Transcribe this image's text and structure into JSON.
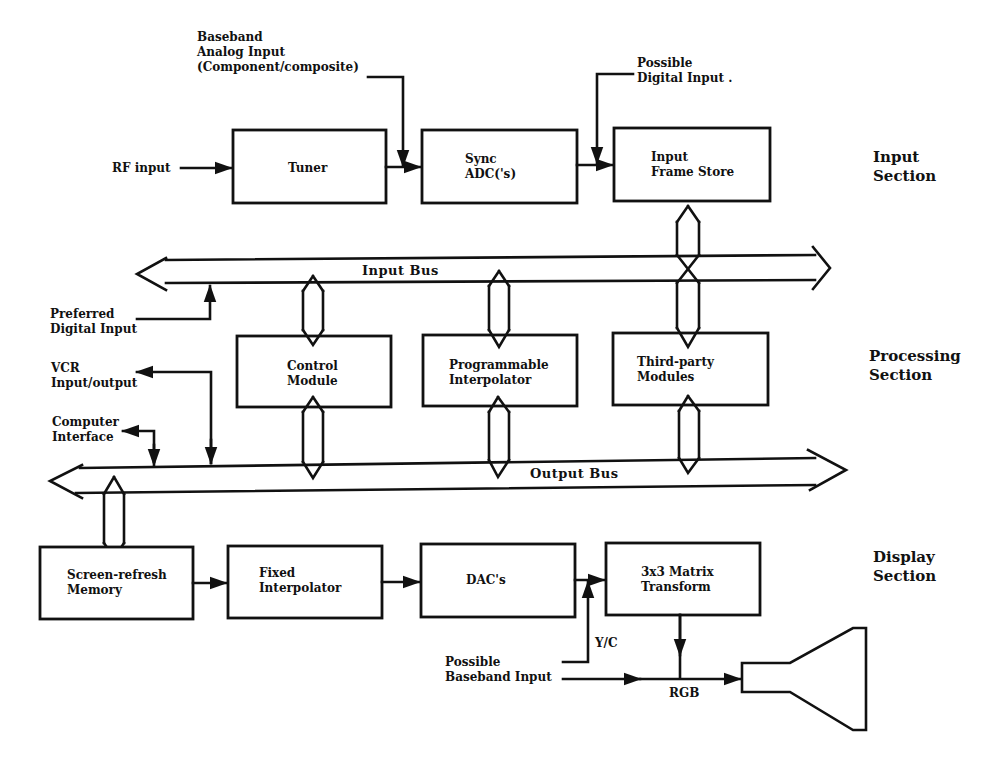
{
  "diagram": {
    "sections": {
      "input": [
        "Input",
        "Section"
      ],
      "processing": [
        "Processing",
        "Section"
      ],
      "display": [
        "Display",
        "Section"
      ]
    },
    "blocks": {
      "tuner": [
        "Tuner"
      ],
      "sync_adc": [
        "Sync",
        "ADC('s)"
      ],
      "input_frame_store": [
        "Input",
        "Frame Store"
      ],
      "control_module": [
        "Control",
        "Module"
      ],
      "programmable_interpolator": [
        "Programmable",
        "Interpolator"
      ],
      "third_party_modules": [
        "Third-party",
        "Modules"
      ],
      "screen_refresh_memory": [
        "Screen-refresh",
        "Memory"
      ],
      "fixed_interpolator": [
        "Fixed",
        "Interpolator"
      ],
      "dacs": [
        "DAC's"
      ],
      "matrix_transform": [
        "3x3 Matrix",
        "Transform"
      ]
    },
    "buses": {
      "input_bus": "Input Bus",
      "output_bus": "Output Bus"
    },
    "signals": {
      "rf_input": [
        "RF input"
      ],
      "baseband_analog_input": [
        "Baseband",
        "Analog Input",
        "(Component/composite)"
      ],
      "possible_digital_input": [
        "Possible",
        "Digital Input ."
      ],
      "preferred_digital_input": [
        "Preferred",
        "Digital Input"
      ],
      "vcr_io": [
        "VCR",
        "Input/output"
      ],
      "computer_interface": [
        "Computer",
        "Interface"
      ],
      "yc": [
        "Y/C"
      ],
      "possible_baseband_input": [
        "Possible",
        "Baseband Input"
      ],
      "rgb": [
        "RGB"
      ]
    },
    "display_device": "crt-monitor-icon"
  }
}
